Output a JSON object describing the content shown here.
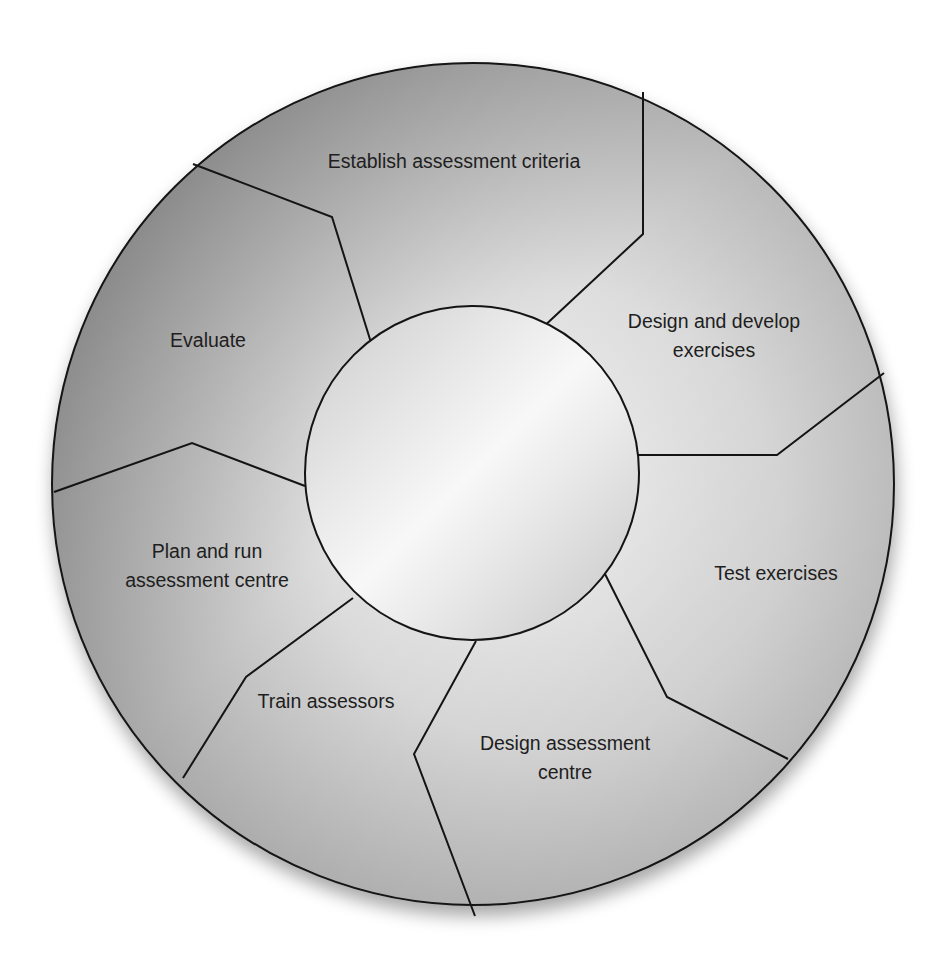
{
  "diagram": {
    "type": "cycle",
    "outer_circle": {
      "cx": 473,
      "cy": 484,
      "r": 421
    },
    "inner_circle": {
      "cx": 472,
      "cy": 473,
      "r": 167
    },
    "colors": {
      "outer_dark": "#7e7e7e",
      "outer_light": "#f4f4f4",
      "inner_light": "#f7f7f7",
      "inner_dark": "#c8c8c8",
      "stroke": "#141414",
      "text": "#1e1e1e",
      "background": "#ffffff"
    },
    "segments": [
      {
        "id": "establish-assessment-criteria",
        "lines": [
          "Establish assessment criteria"
        ],
        "label_x": 454,
        "label_y": 168
      },
      {
        "id": "design-and-develop-exercises",
        "lines": [
          "Design and develop",
          "exercises"
        ],
        "label_x": 714,
        "label_y": 328
      },
      {
        "id": "test-exercises",
        "lines": [
          "Test exercises"
        ],
        "label_x": 776,
        "label_y": 580
      },
      {
        "id": "design-assessment-centre",
        "lines": [
          "Design assessment",
          "centre"
        ],
        "label_x": 565,
        "label_y": 750
      },
      {
        "id": "train-assessors",
        "lines": [
          "Train assessors"
        ],
        "label_x": 326,
        "label_y": 708
      },
      {
        "id": "plan-and-run-assessment-centre",
        "lines": [
          "Plan and run",
          "assessment centre"
        ],
        "label_x": 207,
        "label_y": 558
      },
      {
        "id": "evaluate",
        "lines": [
          "Evaluate"
        ],
        "label_x": 208,
        "label_y": 347
      }
    ],
    "dividers": [
      {
        "between": "evaluate|establish-assessment-criteria",
        "points": "193,164 332,217 373,349"
      },
      {
        "between": "establish-assessment-criteria|design-and-develop-exercises",
        "points": "643,92 643,234 540,330"
      },
      {
        "between": "design-and-develop-exercises|test-exercises",
        "points": "884,373 777,455 638,455"
      },
      {
        "between": "test-exercises|design-assessment-centre",
        "points": "788,759 667,697 603,570"
      },
      {
        "between": "design-assessment-centre|train-assessors",
        "points": "475,916 414,754 476,641"
      },
      {
        "between": "train-assessors|plan-and-run-assessment-centre",
        "points": "183,778 246,677 353,598"
      },
      {
        "between": "plan-and-run-assessment-centre|evaluate",
        "points": "54,492 192,443 305,486"
      }
    ]
  }
}
